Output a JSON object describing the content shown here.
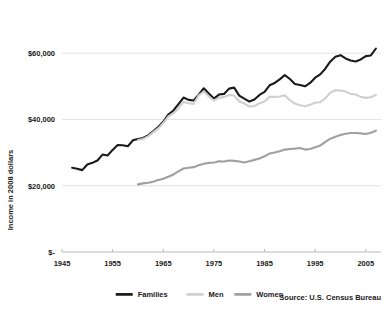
{
  "chart_data": {
    "type": "line",
    "title": "",
    "xlabel": "",
    "ylabel": "Income in 2008 dollars",
    "source": "Source: U.S. Census Bureau",
    "xlim": [
      1945,
      2008
    ],
    "ylim": [
      0,
      70000
    ],
    "xticks": [
      1945,
      1955,
      1965,
      1975,
      1985,
      1995,
      2005
    ],
    "xtick_labels": [
      "1945",
      "1955",
      "1965",
      "1975",
      "1985",
      "1995",
      "2005"
    ],
    "yticks": [
      0,
      20000,
      40000,
      60000
    ],
    "ytick_labels": [
      "$-",
      "$20,000",
      "$40,000",
      "$60,000"
    ],
    "grid": true,
    "legend_position": "bottom",
    "series": [
      {
        "name": "Families",
        "color": "#1a1a1a",
        "width": 2.1,
        "x": [
          1947,
          1948,
          1949,
          1950,
          1951,
          1952,
          1953,
          1954,
          1955,
          1956,
          1957,
          1958,
          1959,
          1960,
          1961,
          1962,
          1963,
          1964,
          1965,
          1966,
          1967,
          1968,
          1969,
          1970,
          1971,
          1972,
          1973,
          1974,
          1975,
          1976,
          1977,
          1978,
          1979,
          1980,
          1981,
          1982,
          1983,
          1984,
          1985,
          1986,
          1987,
          1988,
          1989,
          1990,
          1991,
          1992,
          1993,
          1994,
          1995,
          1996,
          1997,
          1998,
          1999,
          2000,
          2001,
          2002,
          2003,
          2004,
          2005,
          2006,
          2007
        ],
        "values": [
          25400,
          25100,
          24700,
          26400,
          26900,
          27600,
          29400,
          29100,
          30800,
          32300,
          32200,
          31900,
          33700,
          34100,
          34400,
          35200,
          36400,
          37700,
          39300,
          41500,
          42700,
          44600,
          46600,
          45900,
          45700,
          47500,
          49400,
          47800,
          46300,
          47500,
          47700,
          49300,
          49600,
          47200,
          46300,
          45400,
          46000,
          47400,
          48300,
          50300,
          51000,
          52100,
          53400,
          52200,
          50700,
          50400,
          50000,
          51000,
          52600,
          53600,
          55300,
          57500,
          58900,
          59400,
          58400,
          57800,
          57500,
          58100,
          59100,
          59300,
          61400
        ]
      },
      {
        "name": "Men",
        "color": "#cfcfcf",
        "width": 2.1,
        "x": [
          1960,
          1961,
          1962,
          1963,
          1964,
          1965,
          1966,
          1967,
          1968,
          1969,
          1970,
          1971,
          1972,
          1973,
          1974,
          1975,
          1976,
          1977,
          1978,
          1979,
          1980,
          1981,
          1982,
          1983,
          1984,
          1985,
          1986,
          1987,
          1988,
          1989,
          1990,
          1991,
          1992,
          1993,
          1994,
          1995,
          1996,
          1997,
          1998,
          1999,
          2000,
          2001,
          2002,
          2003,
          2004,
          2005,
          2006,
          2007
        ],
        "values": [
          33800,
          34100,
          34900,
          36100,
          37300,
          38900,
          40900,
          41800,
          43400,
          45300,
          44900,
          44700,
          47300,
          48400,
          46900,
          45700,
          46500,
          46800,
          47400,
          47200,
          45400,
          44800,
          43900,
          44000,
          44900,
          45400,
          46800,
          46800,
          46900,
          47300,
          45800,
          44800,
          44300,
          44000,
          44400,
          45100,
          45200,
          46400,
          48100,
          48800,
          48700,
          48400,
          47700,
          47500,
          46800,
          46500,
          46700,
          47400
        ]
      },
      {
        "name": "Women",
        "color": "#a0a0a0",
        "width": 2.1,
        "x": [
          1960,
          1961,
          1962,
          1963,
          1964,
          1965,
          1966,
          1967,
          1968,
          1969,
          1970,
          1971,
          1972,
          1973,
          1974,
          1975,
          1976,
          1977,
          1978,
          1979,
          1980,
          1981,
          1982,
          1983,
          1984,
          1985,
          1986,
          1987,
          1988,
          1989,
          1990,
          1991,
          1992,
          1993,
          1994,
          1995,
          1996,
          1997,
          1998,
          1999,
          2000,
          2001,
          2002,
          2003,
          2004,
          2005,
          2006,
          2007
        ],
        "values": [
          20400,
          20700,
          20900,
          21200,
          21700,
          22100,
          22700,
          23400,
          24300,
          25200,
          25400,
          25600,
          26200,
          26600,
          26900,
          27000,
          27400,
          27300,
          27600,
          27500,
          27300,
          27000,
          27400,
          27800,
          28200,
          28900,
          29700,
          30000,
          30400,
          30900,
          31100,
          31200,
          31400,
          30900,
          31100,
          31600,
          32100,
          33200,
          34200,
          34800,
          35300,
          35700,
          35900,
          35900,
          35800,
          35600,
          36000,
          36600
        ]
      }
    ]
  },
  "axis": {
    "ylabel": "Income in 2008 dollars"
  },
  "legend": {
    "items": [
      {
        "label": "Families"
      },
      {
        "label": "Men"
      },
      {
        "label": "Women"
      }
    ]
  },
  "footer": {
    "source": "Source: U.S. Census Bureau"
  }
}
